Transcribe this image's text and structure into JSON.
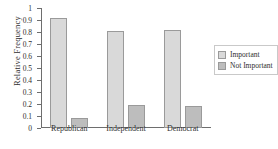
{
  "chart_data": {
    "type": "bar",
    "title": "",
    "xlabel": "",
    "ylabel": "Relative Frequency",
    "ylim": [
      0,
      1
    ],
    "yticks": [
      "0",
      "0.1",
      "0.2",
      "0.3",
      "0.4",
      "0.5",
      "0.6",
      "0.7",
      "0.8",
      "0.9",
      "1"
    ],
    "ytick_values": [
      0,
      0.1,
      0.2,
      0.3,
      0.4,
      0.5,
      0.6,
      0.7,
      0.8,
      0.9,
      1
    ],
    "grid": false,
    "legend_position": "right",
    "categories": [
      "Republican",
      "Independent",
      "Democrat"
    ],
    "series": [
      {
        "name": "Important",
        "color": "#d9d9d9",
        "values": [
          0.92,
          0.81,
          0.82
        ]
      },
      {
        "name": "Not Important",
        "color": "#bdbdbd",
        "values": [
          0.08,
          0.19,
          0.18
        ]
      }
    ]
  },
  "legend": {
    "items": [
      {
        "label": "Important",
        "swatch": "important"
      },
      {
        "label": "Not Important",
        "swatch": "notimportant"
      }
    ]
  },
  "colors": {
    "important": "#d9d9d9",
    "not_important": "#bdbdbd",
    "axis": "#6e6e6e",
    "bar_border": "#9a9a9a",
    "text": "#2e2e2e",
    "background": "#ffffff"
  }
}
